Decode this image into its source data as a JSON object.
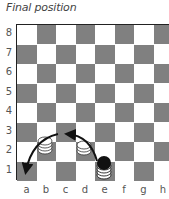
{
  "title": "Final position",
  "board": {
    "files": [
      "a",
      "b",
      "c",
      "d",
      "e",
      "f",
      "g",
      "h"
    ],
    "ranks": [
      "8",
      "7",
      "6",
      "5",
      "4",
      "3",
      "2",
      "1"
    ],
    "colors": {
      "dark": "#808080",
      "light": "#ffffff",
      "border": "#222222"
    }
  },
  "pieces": [
    {
      "square": "b2",
      "color": "white",
      "stack": 3
    },
    {
      "square": "d2",
      "color": "white",
      "stack": 2
    },
    {
      "square": "e1",
      "color": "black",
      "stack": 3
    }
  ],
  "arrows": [
    {
      "from": "e1",
      "to": "c3",
      "label": "move-arc-1"
    },
    {
      "from": "c3",
      "to": "a1",
      "label": "move-arc-2"
    }
  ]
}
